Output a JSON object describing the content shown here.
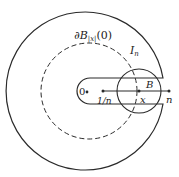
{
  "diagram": {
    "labels": {
      "boundary_ball": "∂B",
      "boundary_ball_sub": "|x|",
      "boundary_ball_arg": "(0)",
      "contour": "I",
      "contour_sub": "n",
      "origin": "0",
      "inner_point": "1/n",
      "ball": "B",
      "point_x": "x",
      "outer_point": "n"
    },
    "colors": {
      "stroke": "#2a2a2a",
      "background": "#ffffff"
    }
  }
}
